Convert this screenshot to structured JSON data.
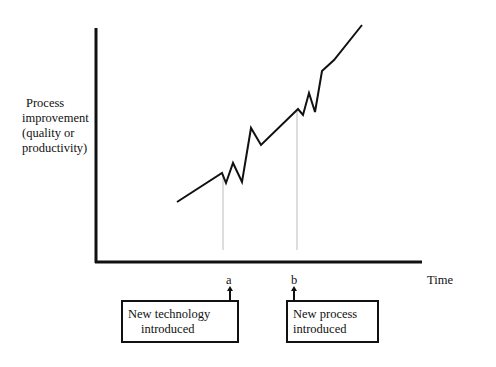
{
  "chart_data": {
    "type": "line",
    "title": "",
    "ylabel": "Process improvement (quality or productivity)",
    "ylabel_lines": [
      "Process",
      "improvement",
      "(quality or",
      "productivity)"
    ],
    "xlabel": "Time",
    "grid": false,
    "legend": null,
    "series": [
      {
        "name": "Process improvement over time",
        "description": "Steady upward trend, with oscillating dips/spikes after each intervention, followed by a steeper improvement slope",
        "points_px": [
          [
            177,
            202
          ],
          [
            222,
            173
          ],
          [
            226,
            183
          ],
          [
            233,
            163
          ],
          [
            242,
            182
          ],
          [
            251,
            128
          ],
          [
            261,
            145
          ],
          [
            298,
            109
          ],
          [
            303,
            115
          ],
          [
            309,
            93
          ],
          [
            315,
            112
          ],
          [
            322,
            71
          ],
          [
            334,
            60
          ],
          [
            362,
            25
          ]
        ]
      }
    ],
    "markers": [
      {
        "id": "a",
        "label": "a",
        "x_px": 223,
        "annotation": "New technology introduced",
        "annotation_lines": [
          "New technology",
          "introduced"
        ]
      },
      {
        "id": "b",
        "label": "b",
        "x_px": 297,
        "annotation": "New process introduced",
        "annotation_lines": [
          "New process",
          "introduced"
        ]
      }
    ]
  },
  "axes": {
    "y_label_lines": [
      "Process",
      "improvement",
      "(quality or",
      "productivity)"
    ],
    "x_label": "Time"
  },
  "markers": {
    "a": {
      "letter": "a",
      "box_line1": "New technology",
      "box_line2": "introduced"
    },
    "b": {
      "letter": "b",
      "box_line1": "New process",
      "box_line2": "introduced"
    }
  },
  "colors": {
    "line": "#111111",
    "guide": "#bbbbbb",
    "background": "#ffffff"
  }
}
